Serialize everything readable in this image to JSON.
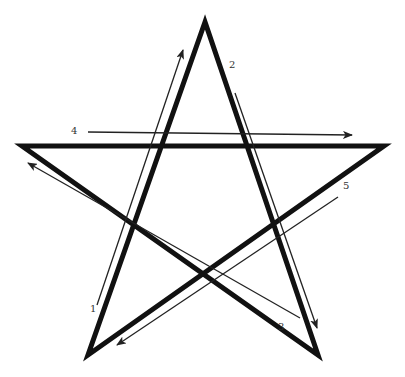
{
  "diagram": {
    "type": "pentagram-stroke-order",
    "colors": {
      "star_stroke": "#111111",
      "arrow_stroke": "#222222",
      "label_text": "#333333",
      "background": "#ffffff"
    },
    "star": {
      "stroke_width": 5,
      "vertices": {
        "top": [
          205,
          22
        ],
        "left": [
          22,
          146
        ],
        "right": [
          384,
          146
        ],
        "bottom_left": [
          88,
          355
        ],
        "bottom_right": [
          318,
          355
        ]
      }
    },
    "arrows": [
      {
        "label": "1",
        "from": [
          97,
          305
        ],
        "to": [
          183,
          50
        ],
        "label_pos": [
          90,
          304
        ]
      },
      {
        "label": "2",
        "from": [
          235,
          93
        ],
        "to": [
          317,
          328
        ],
        "label_pos": [
          229,
          60
        ]
      },
      {
        "label": "3",
        "from": [
          300,
          318
        ],
        "to": [
          28,
          163
        ],
        "label_pos": [
          278,
          322
        ]
      },
      {
        "label": "4",
        "from": [
          88,
          132
        ],
        "to": [
          352,
          135
        ],
        "label_pos": [
          71,
          126
        ]
      },
      {
        "label": "5",
        "from": [
          338,
          197
        ],
        "to": [
          117,
          345
        ],
        "label_pos": [
          343,
          181
        ]
      }
    ]
  },
  "labels": {
    "l1": "1",
    "l2": "2",
    "l3": "3",
    "l4": "4",
    "l5": "5"
  }
}
